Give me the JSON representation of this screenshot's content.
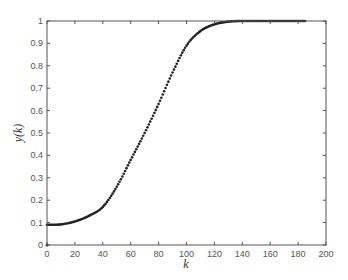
{
  "chart_data": {
    "type": "scatter",
    "title": "",
    "xlabel": "k",
    "ylabel": "y(k)",
    "xlim": [
      0,
      200
    ],
    "ylim": [
      0,
      1
    ],
    "xticks": [
      0,
      20,
      40,
      60,
      80,
      100,
      120,
      140,
      160,
      180,
      200
    ],
    "yticks": [
      0,
      0.1,
      0.2,
      0.3,
      0.4,
      0.5,
      0.6,
      0.7,
      0.8,
      0.9,
      1
    ],
    "ytick_labels": [
      "0",
      "0.1",
      "0.2",
      "0.3",
      "0.4",
      "0.5",
      "0.6",
      "0.7",
      "0.8",
      "0.9",
      "1"
    ],
    "grid": false,
    "legend": null,
    "series": [
      {
        "name": "y(k)",
        "marker": "dot",
        "color": "#222222",
        "anchor_x": [
          0,
          10,
          20,
          30,
          40,
          50,
          60,
          70,
          80,
          90,
          100,
          110,
          120,
          130,
          140,
          160,
          185
        ],
        "anchor_y": [
          0.09,
          0.092,
          0.105,
          0.13,
          0.17,
          0.26,
          0.38,
          0.5,
          0.63,
          0.77,
          0.89,
          0.955,
          0.985,
          0.997,
          1.0,
          1.0,
          1.0
        ],
        "k_step": 1,
        "k_max": 185
      }
    ],
    "extra_points": [
      {
        "x": 0,
        "y": 0
      }
    ]
  },
  "colors": {
    "axis": "#555555",
    "marker": "#222222",
    "background": "#ffffff"
  }
}
